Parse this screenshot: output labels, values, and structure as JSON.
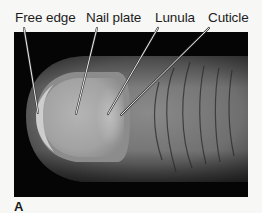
{
  "figure": {
    "panel_letter": "A",
    "labels": [
      {
        "id": "free-edge",
        "text": "Free edge",
        "x": 15,
        "line_from": [
          24,
          28
        ],
        "line_to": [
          38,
          113
        ]
      },
      {
        "id": "nail-plate",
        "text": "Nail plate",
        "x": 86,
        "line_from": [
          97,
          28
        ],
        "line_to": [
          76,
          114
        ]
      },
      {
        "id": "lunula",
        "text": "Lunula",
        "x": 155,
        "line_from": [
          158,
          28
        ],
        "line_to": [
          108,
          114
        ]
      },
      {
        "id": "cuticle",
        "text": "Cuticle",
        "x": 208,
        "line_from": [
          209,
          28
        ],
        "line_to": [
          121,
          115
        ]
      }
    ],
    "photo": {
      "subject": "fingertip-with-nail",
      "background_color": "#050505",
      "skin_color": "#7a7a7a",
      "nail_color": "#a9a9a9"
    }
  }
}
